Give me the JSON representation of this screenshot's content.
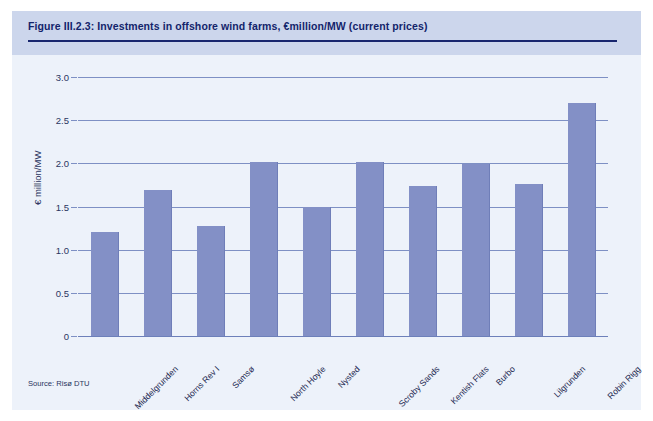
{
  "figure": {
    "title": "Figure III.2.3: Investments in offshore wind farms, €million/MW (current prices)",
    "source": "Source: Risø DTU",
    "colors": {
      "panel_background": "#edf2fa",
      "header_band": "#ccd6ec",
      "title_text": "#13246b",
      "title_rule": "#18266e",
      "bar_fill": "#8390c6",
      "gridline": "#7e90c4",
      "axis_text": "#2a3560"
    }
  },
  "chart_data": {
    "type": "bar",
    "title": "Figure III.2.3: Investments in offshore wind farms, €million/MW (current prices)",
    "xlabel": "",
    "ylabel": "€ million/MW",
    "ylim": [
      0,
      3.0
    ],
    "yticks": [
      0,
      0.5,
      1.0,
      1.5,
      2.0,
      2.5,
      3.0
    ],
    "ytick_labels": [
      "0",
      "0.5",
      "1.0",
      "1.5",
      "2.0",
      "2.5",
      "3.0"
    ],
    "grid": true,
    "legend": false,
    "categories": [
      "Middelgrunden",
      "Horns Rev I",
      "Samsø",
      "North Hoyle",
      "Nysted",
      "Scroby Sands",
      "Kentish Flats",
      "Burbo",
      "Lilgrunden",
      "Robin Rigg"
    ],
    "values": [
      1.2,
      1.69,
      1.28,
      2.02,
      1.5,
      2.01,
      1.74,
      1.99,
      1.76,
      2.7
    ],
    "series": [
      {
        "name": "Investment (€ million/MW)",
        "values": [
          1.2,
          1.69,
          1.28,
          2.02,
          1.5,
          2.01,
          1.74,
          1.99,
          1.76,
          2.7
        ]
      }
    ]
  }
}
